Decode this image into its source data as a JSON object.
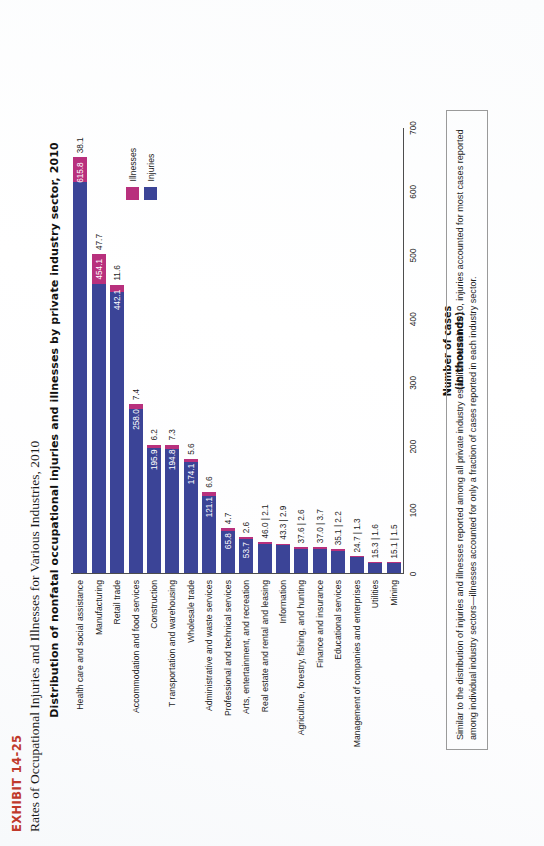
{
  "exhibit": {
    "tag": "EXHIBIT 14-25",
    "subtitle": "Rates of Occupational Injuries and Illnesses for Various Industries, 2010"
  },
  "caption": "Similar to the distribution of injuries and illnesses reported among all private industry establishments in 2010, injuries accounted for most cases reported among individual industry sectors—illnesses accounted for only a fraction of cases reported in each industry sector.",
  "legend": {
    "items": [
      {
        "label": "Illnesses",
        "color": "#b8307d"
      },
      {
        "label": "Injuries",
        "color": "#3b4497"
      }
    ]
  },
  "colors": {
    "injuries": "#3b4497",
    "illnesses": "#b8307d",
    "exhibit_tag": "#c0392b",
    "axis": "#4d4d4d"
  },
  "chart_data": {
    "type": "bar",
    "orientation": "horizontal",
    "stacked": true,
    "title": "Distribution of nonfatal occupational injuries and illnesses by private industry sector, 2010",
    "xlabel": "Number of cases",
    "xlabel_sub": "(in thousands)",
    "ylabel": "",
    "xlim": [
      0,
      700
    ],
    "xticks": [
      0,
      100,
      200,
      300,
      400,
      500,
      600,
      700
    ],
    "xticklabels": [
      "0",
      "100",
      "200",
      "300",
      "400",
      "500",
      "600",
      "700"
    ],
    "grid": false,
    "legend_position": "top-right",
    "categories": [
      "Health care and social assistance",
      "Manufacturing",
      "Retail trade",
      "Accommodation and food services",
      "Construction",
      "T ransportation and warehousing",
      "Wholesale trade",
      "Administrative and waste services",
      "Professional and technical services",
      "Arts, entertainment, and recreation",
      "Real estate and rental and leasing",
      "Information",
      "Agriculture, forestry, fishing, and hunting",
      "Finance and insurance",
      "Educational services",
      "Management of companies and enterprises",
      "Utilities",
      "Mining"
    ],
    "series": [
      {
        "name": "Injuries",
        "color": "#3b4497",
        "values": [
          615.8,
          454.1,
          442.1,
          258.0,
          195.9,
          194.8,
          174.1,
          121.1,
          65.8,
          53.7,
          46.0,
          43.3,
          37.6,
          37.0,
          35.1,
          24.7,
          15.3,
          15.1
        ]
      },
      {
        "name": "Illnesses",
        "color": "#b8307d",
        "values": [
          38.1,
          47.7,
          11.6,
          7.4,
          6.2,
          7.3,
          5.6,
          6.6,
          4.7,
          2.6,
          2.1,
          2.9,
          2.6,
          3.7,
          2.2,
          1.3,
          1.6,
          1.5
        ]
      }
    ],
    "point_labels": [
      {
        "category": "Health care and social assistance",
        "injuries": "615.8",
        "illnesses": "38.1"
      },
      {
        "category": "Manufacturing",
        "injuries": "454.1",
        "illnesses": "47.7"
      },
      {
        "category": "Retail trade",
        "injuries": "442.1",
        "illnesses": "11.6"
      },
      {
        "category": "Accommodation and food services",
        "injuries": "258.0",
        "illnesses": "7.4"
      },
      {
        "category": "Construction",
        "injuries": "195.9",
        "illnesses": "6.2"
      },
      {
        "category": "T ransportation and warehousing",
        "injuries": "194.8",
        "illnesses": "7.3"
      },
      {
        "category": "Wholesale trade",
        "injuries": "174.1",
        "illnesses": "5.6"
      },
      {
        "category": "Administrative and waste services",
        "injuries": "121.1",
        "illnesses": "6.6"
      },
      {
        "category": "Professional and technical services",
        "injuries": "65.8",
        "illnesses": "4.7"
      },
      {
        "category": "Arts, entertainment, and recreation",
        "injuries": "53.7",
        "illnesses": "2.6"
      },
      {
        "category": "Real estate and rental and leasing",
        "injuries": "46.0",
        "illnesses": "2.1"
      },
      {
        "category": "Information",
        "injuries": "43.3",
        "illnesses": "2.9"
      },
      {
        "category": "Agriculture, forestry, fishing, and hunting",
        "injuries": "37.6",
        "illnesses": "2.6"
      },
      {
        "category": "Finance and insurance",
        "injuries": "37.0",
        "illnesses": "3.7"
      },
      {
        "category": "Educational services",
        "injuries": "35.1",
        "illnesses": "2.2"
      },
      {
        "category": "Management of companies and enterprises",
        "injuries": "24.7",
        "illnesses": "1.3"
      },
      {
        "category": "Utilities",
        "injuries": "15.3",
        "illnesses": "1.6"
      },
      {
        "category": "Mining",
        "injuries": "15.1",
        "illnesses": "1.5"
      }
    ]
  }
}
